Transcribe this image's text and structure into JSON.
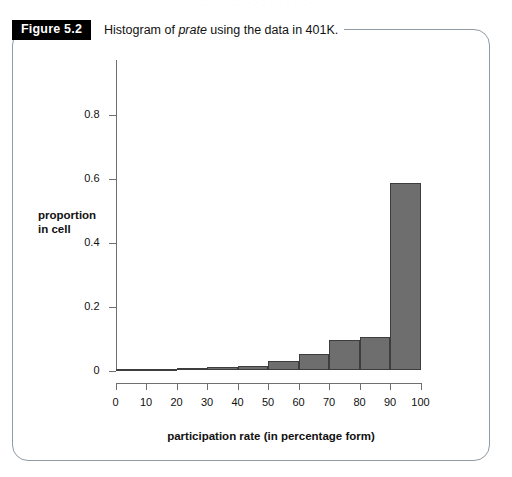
{
  "figure": {
    "badge_label": "Figure 5.2",
    "caption_prefix": "Histogram of ",
    "caption_italic": "prate",
    "caption_suffix": " using the data in 401K.",
    "top_bleed_text": ". . . . . . . . . . . . ."
  },
  "chart_data": {
    "type": "bar",
    "title": "Histogram of prate using the data in 401K.",
    "xlabel": "participation rate (in percentage form)",
    "ylabel": "proportion in cell",
    "ylabel_line1": "proportion",
    "ylabel_line2": "in cell",
    "grid": false,
    "legend": "none",
    "xlim": [
      0,
      100
    ],
    "ylim": [
      0,
      0.9
    ],
    "xticks": [
      0,
      10,
      20,
      30,
      40,
      50,
      60,
      70,
      80,
      90,
      100
    ],
    "xtick_labels": [
      "0",
      "10",
      "20",
      "30",
      "40",
      "50",
      "60",
      "70",
      "80",
      "90",
      "100"
    ],
    "yticks": [
      0,
      0.2,
      0.4,
      0.6,
      0.8
    ],
    "ytick_labels": [
      "0",
      "0.2",
      "0.4",
      "0.6",
      "0.8"
    ],
    "bin_edges": [
      0,
      10,
      20,
      30,
      40,
      50,
      60,
      70,
      80,
      90,
      100
    ],
    "categories": [
      "0-10",
      "10-20",
      "20-30",
      "30-40",
      "40-50",
      "50-60",
      "60-70",
      "70-80",
      "80-90",
      "90-100"
    ],
    "values": [
      0.002,
      0.002,
      0.009,
      0.011,
      0.015,
      0.031,
      0.051,
      0.095,
      0.106,
      0.585
    ],
    "bar_color": "#6e6e6e",
    "bar_edge_color": "#3d3d3d",
    "axis_color": "#6f6f6f"
  }
}
